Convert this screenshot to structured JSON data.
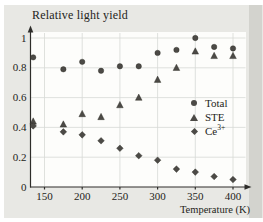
{
  "figure": {
    "title": "Relative light yield",
    "xlabel": "Temperature (K)"
  },
  "legend": {
    "items": [
      {
        "label": "Total",
        "sup": "",
        "marker": "circle"
      },
      {
        "label": "STE",
        "sup": "",
        "marker": "triangle"
      },
      {
        "label": "Ce",
        "sup": "3+",
        "marker": "diamond"
      }
    ]
  },
  "colors": {
    "panel_bg": "#e8e8e4",
    "panel_shade": "#d3d3ce",
    "plot_bg": "#fdfdfb",
    "grid": "#d7d9d5",
    "axis": "#2e2d2a",
    "marker": "#4c4a46",
    "text": "#242420"
  },
  "chart_data": {
    "type": "scatter",
    "title": "Relative light yield",
    "xlabel": "Temperature (K)",
    "ylabel": "",
    "x": [
      135,
      175,
      200,
      225,
      250,
      275,
      300,
      325,
      350,
      375,
      400
    ],
    "series": [
      {
        "name": "Total",
        "marker": "circle",
        "values": [
          0.87,
          0.79,
          0.84,
          0.78,
          0.81,
          0.81,
          0.9,
          0.92,
          1.0,
          0.94,
          0.93
        ]
      },
      {
        "name": "STE",
        "marker": "triangle",
        "values": [
          0.44,
          0.42,
          0.49,
          0.47,
          0.55,
          0.6,
          0.72,
          0.8,
          0.91,
          0.88,
          0.88
        ]
      },
      {
        "name": "Ce3+",
        "marker": "diamond",
        "values": [
          0.41,
          0.37,
          0.35,
          0.31,
          0.26,
          0.21,
          0.18,
          0.12,
          0.1,
          0.07,
          0.05
        ]
      }
    ],
    "xticks": [
      150,
      200,
      250,
      300,
      350,
      400
    ],
    "yticks": [
      0,
      0.2,
      0.4,
      0.6,
      0.8,
      1
    ],
    "xlim": [
      131,
      426
    ],
    "ylim": [
      0,
      1.06
    ],
    "grid": true,
    "legend_position": "center-right"
  }
}
